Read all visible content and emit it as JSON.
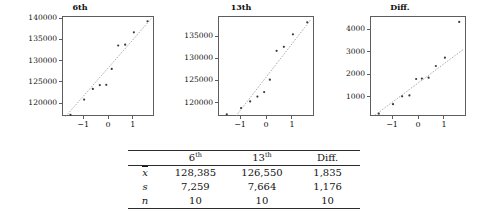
{
  "chart_data": [
    {
      "type": "scatter",
      "title": "6th",
      "xlabel": "",
      "ylabel": "",
      "xlim": [
        -1.85,
        1.85
      ],
      "ylim": [
        117000,
        140500
      ],
      "xticks": [
        -1,
        0,
        1
      ],
      "xtick_labels": [
        "−1",
        "0",
        "1"
      ],
      "yticks": [
        120000,
        125000,
        130000,
        135000,
        140000
      ],
      "ytick_labels": [
        "120000",
        "125000",
        "130000",
        "135000",
        "140000"
      ],
      "grid": false,
      "legend": "none",
      "x": [
        -1.55,
        -1.0,
        -0.65,
        -0.37,
        -0.11,
        0.11,
        0.37,
        0.65,
        1.0,
        1.55
      ],
      "y": [
        117500,
        121100,
        123600,
        124500,
        124550,
        128300,
        133800,
        134000,
        136900,
        139500
      ],
      "reference_line": {
        "x": [
          -1.75,
          1.7
        ],
        "y": [
          117100,
          140100
        ],
        "style": "dashed"
      }
    },
    {
      "type": "scatter",
      "title": "13th",
      "xlabel": "",
      "ylabel": "",
      "xlim": [
        -1.85,
        1.85
      ],
      "ylim": [
        117000,
        139500
      ],
      "xticks": [
        -1,
        0,
        1
      ],
      "xtick_labels": [
        "−1",
        "0",
        "1"
      ],
      "yticks": [
        120000,
        125000,
        130000,
        135000
      ],
      "ytick_labels": [
        "120000",
        "125000",
        "130000",
        "135000"
      ],
      "grid": false,
      "legend": "none",
      "x": [
        -1.55,
        -1.0,
        -0.65,
        -0.37,
        -0.11,
        0.11,
        0.37,
        0.65,
        1.0,
        1.55
      ],
      "y": [
        117600,
        119000,
        120500,
        121600,
        122600,
        125400,
        131900,
        132800,
        135600,
        138300
      ],
      "reference_line": {
        "x": [
          -1.2,
          1.7
        ],
        "y": [
          117200,
          139000
        ],
        "style": "dashed"
      }
    },
    {
      "type": "scatter",
      "title": "Diff.",
      "xlabel": "",
      "ylabel": "",
      "xlim": [
        -1.85,
        1.85
      ],
      "ylim": [
        150,
        4600
      ],
      "xticks": [
        -1,
        0,
        1
      ],
      "xtick_labels": [
        "−1",
        "0",
        "1"
      ],
      "yticks": [
        1000,
        2000,
        3000,
        4000
      ],
      "ytick_labels": [
        "1000",
        "2000",
        "3000",
        "4000"
      ],
      "grid": false,
      "legend": "none",
      "x": [
        -1.55,
        -1.0,
        -0.65,
        -0.37,
        -0.11,
        0.11,
        0.37,
        0.65,
        1.0,
        1.55
      ],
      "y": [
        300,
        720,
        1070,
        1110,
        1840,
        1860,
        1900,
        2420,
        2790,
        4380
      ],
      "reference_line": {
        "x": [
          -1.7,
          1.7
        ],
        "y": [
          230,
          3150
        ],
        "style": "dashed"
      }
    }
  ],
  "table": {
    "corner_label": "",
    "columns": [
      {
        "base": "6",
        "sup": "th"
      },
      {
        "base": "13",
        "sup": "th"
      },
      {
        "base": "Diff.",
        "sup": ""
      }
    ],
    "rows": [
      {
        "label": "x",
        "label_kind": "xbar",
        "values": [
          "128,385",
          "126,550",
          "1,835"
        ]
      },
      {
        "label": "s",
        "label_kind": "plain",
        "values": [
          "7,259",
          "7,664",
          "1,176"
        ]
      },
      {
        "label": "n",
        "label_kind": "plain",
        "values": [
          "10",
          "10",
          "10"
        ]
      }
    ]
  },
  "colors": {
    "axis": "#5d5d5d",
    "point": "#3a3a3a",
    "rule": "#2b2b2b",
    "text": "#131313",
    "background": "#ffffff"
  }
}
